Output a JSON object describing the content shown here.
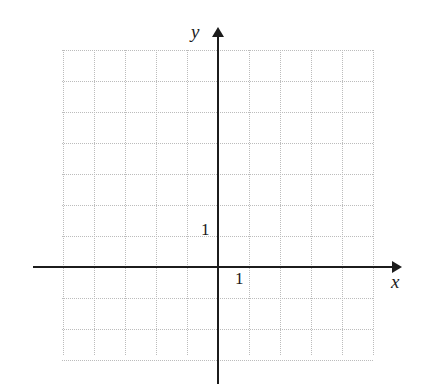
{
  "figure": {
    "kind": "cartesian-coordinate-grid",
    "background_color": "#ffffff",
    "grid_color": "#bcbcbc",
    "axis_color": "#1c1c1c",
    "text_color": "#1b1b1b"
  },
  "labels": {
    "y_axis": "y",
    "x_axis": "x",
    "y_unit_tick": "1",
    "x_unit_tick": "1"
  },
  "icons": {
    "x_arrow": "arrow-right-icon",
    "y_arrow": "arrow-up-icon"
  },
  "chart_data": {
    "type": "scatter",
    "title": "",
    "xlabel": "x",
    "ylabel": "y",
    "series": [],
    "x": [],
    "values": [],
    "grid": true,
    "grid_style": "dotted",
    "legend": "none",
    "origin_px": [
      218,
      267
    ],
    "unit_px": 31,
    "xlim": [
      -5,
      5
    ],
    "ylim": [
      -3,
      7
    ],
    "xticks": [
      1
    ],
    "yticks": [
      1
    ],
    "xtick_labels": [
      "1"
    ],
    "ytick_labels": [
      "1"
    ],
    "grid_vertical_x": [
      -5,
      -4,
      -3,
      -2,
      -1,
      0,
      1,
      2,
      3,
      4,
      5
    ],
    "grid_horizontal_y": [
      -3,
      -2,
      -1,
      0,
      1,
      2,
      3,
      4,
      5,
      6,
      7
    ],
    "annotations": []
  }
}
